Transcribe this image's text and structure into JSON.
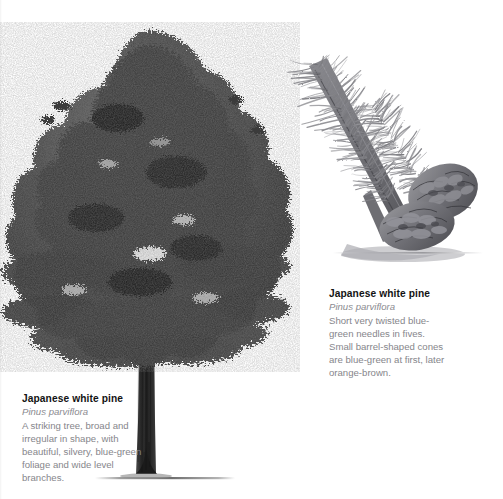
{
  "page": {
    "background_color": "#ffffff",
    "heading_color": "#131313",
    "latin_color": "#8a8a8f",
    "body_color": "#86868b"
  },
  "captions": {
    "tree": {
      "title": "Japanese white pine",
      "latin_name": "Pinus parviflora",
      "description": "A striking tree, broad and\nirregular in shape, with\nbeautiful, silvery, blue-green\nfoliage and wide level\nbranches."
    },
    "branch": {
      "title": "Japanese white pine",
      "latin_name": "Pinus parviflora",
      "description": "Short very twisted blue-\ngreen needles in fives.\nSmall barrel-shaped cones\nare blue-green at first, later\norange-brown."
    }
  },
  "illustrations": {
    "tree": {
      "name": "japanese-white-pine-whole-tree",
      "subject": "whole tree",
      "medium": "grayscale pencil illustration",
      "foliage_color": "#4a4a4a",
      "trunk_color": "#2b2b2b",
      "ground_shadow_color": "#9a9a9a"
    },
    "branch": {
      "name": "japanese-white-pine-branch-with-cones",
      "subject": "branch with needles and two cones",
      "medium": "grayscale pencil illustration",
      "needle_color": "#8e8e92",
      "cone_color": "#6e6e72",
      "ground_shadow_color": "#b0b0b4"
    }
  }
}
